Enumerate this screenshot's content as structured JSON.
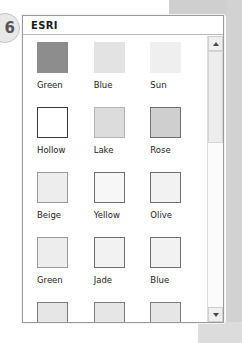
{
  "annotation": {
    "badge_number": "6"
  },
  "dialog": {
    "title": "ESRI",
    "scrollbar": {
      "up_arrow": "scroll-up-arrow",
      "down_arrow": "scroll-down-arrow"
    }
  },
  "palette": {
    "rows": [
      [
        {
          "label": "Green",
          "fill": "#8d8d8d",
          "border": "#8d8d8d"
        },
        {
          "label": "Blue",
          "fill": "#e3e3e3",
          "border": "#e3e3e3"
        },
        {
          "label": "Sun",
          "fill": "#efefef",
          "border": "#efefef"
        }
      ],
      [
        {
          "label": "Hollow",
          "fill": "#ffffff",
          "border": "#3a3a3a"
        },
        {
          "label": "Lake",
          "fill": "#dcdcdc",
          "border": "#b4b4b4"
        },
        {
          "label": "Rose",
          "fill": "#cfcfcf",
          "border": "#6e6e6e"
        }
      ],
      [
        {
          "label": "Beige",
          "fill": "#ededed",
          "border": "#9a9a9a"
        },
        {
          "label": "Yellow",
          "fill": "#f7f7f7",
          "border": "#6e6e6e"
        },
        {
          "label": "Olive",
          "fill": "#f2f2f2",
          "border": "#6e6e6e"
        }
      ],
      [
        {
          "label": "Green",
          "fill": "#ededed",
          "border": "#9a9a9a"
        },
        {
          "label": "Jade",
          "fill": "#f2f2f2",
          "border": "#6e6e6e"
        },
        {
          "label": "Blue",
          "fill": "#f2f2f2",
          "border": "#6e6e6e"
        }
      ],
      [
        {
          "label": "",
          "fill": "#e6e6e6",
          "border": "#7a7a7a"
        },
        {
          "label": "",
          "fill": "#e6e6e6",
          "border": "#7a7a7a"
        },
        {
          "label": "",
          "fill": "#e6e6e6",
          "border": "#7a7a7a"
        }
      ]
    ]
  }
}
